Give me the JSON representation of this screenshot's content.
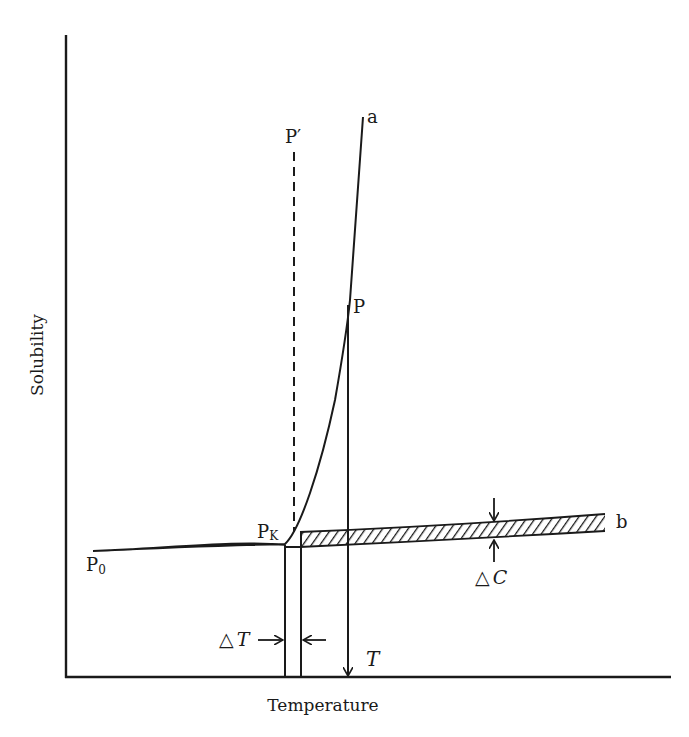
{
  "diagram": {
    "type": "solubility-temperature curve",
    "axes": {
      "x_label": "Temperature",
      "y_label": "Solubility"
    },
    "curves": {
      "a_label": "a",
      "b_label": "b",
      "p0_label": "P",
      "p0_sub": "0",
      "pk_label": "P",
      "pk_sub": "K",
      "p_label": "P",
      "p_prime_label": "P′"
    },
    "annotations": {
      "delta_t_label": "△T",
      "delta_t_symbol": "△",
      "delta_t_var": "T",
      "delta_c_symbol": "△",
      "delta_c_var": "C",
      "t_label": "T"
    },
    "colors": {
      "ink": "#1a1a1a",
      "background": "#ffffff"
    }
  }
}
